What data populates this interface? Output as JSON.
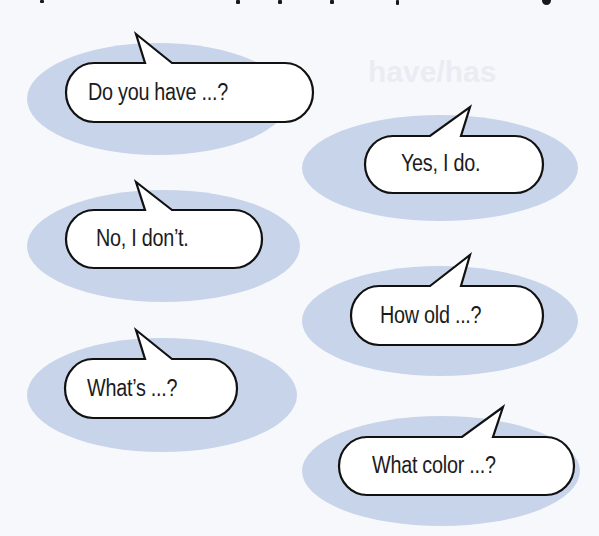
{
  "page": {
    "background_color": "#f6f8fc",
    "ellipse_color": "#c8d4ea",
    "bubble_fill": "#ffffff",
    "bubble_stroke": "#111111",
    "ghost_heading": "have/has"
  },
  "bubbles": [
    {
      "id": "do-you-have",
      "text": "Do you have ...?",
      "column": "left"
    },
    {
      "id": "yes-i-do",
      "text": "Yes, I do.",
      "column": "right"
    },
    {
      "id": "no-i-dont",
      "text": "No, I don’t.",
      "column": "left"
    },
    {
      "id": "how-old",
      "text": "How old ...?",
      "column": "right"
    },
    {
      "id": "whats",
      "text": "What’s ...?",
      "column": "left"
    },
    {
      "id": "what-color",
      "text": "What color ...?",
      "column": "right"
    }
  ]
}
